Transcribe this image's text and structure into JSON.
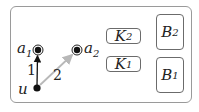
{
  "diagram": {
    "nodes": [
      {
        "id": "a1",
        "label": "a",
        "sub": "1",
        "type": "accepting"
      },
      {
        "id": "a2",
        "label": "a",
        "sub": "2",
        "type": "accepting"
      },
      {
        "id": "u",
        "label": "u",
        "sub": "",
        "type": "plain"
      }
    ],
    "edges": [
      {
        "from": "u",
        "to": "a1",
        "label": "1",
        "color": "#111111"
      },
      {
        "from": "u",
        "to": "a2",
        "label": "2",
        "color": "#b8b8b8"
      }
    ],
    "boxes": [
      {
        "id": "K2",
        "label": "K",
        "sub": "2"
      },
      {
        "id": "K1",
        "label": "K",
        "sub": "1"
      },
      {
        "id": "B2",
        "label": "B",
        "sub": "2"
      },
      {
        "id": "B1",
        "label": "B",
        "sub": "1"
      }
    ]
  }
}
